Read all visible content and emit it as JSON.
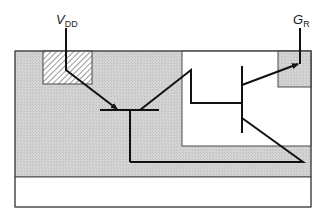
{
  "diagram": {
    "type": "transistor-cross-section",
    "labels": {
      "vdd": {
        "main": "V",
        "sub": "DD"
      },
      "gr": {
        "main": "G",
        "sub": "R"
      }
    },
    "colors": {
      "substrate": "#d0d0d0",
      "well": "#ffffff",
      "outline": "#4a4a4a",
      "wire": "#111111",
      "hatch": "#555555",
      "background": "#ffffff"
    },
    "regions": [
      {
        "name": "p-substrate",
        "fill": "substrate"
      },
      {
        "name": "hatched-contact",
        "fill": "hatch"
      },
      {
        "name": "n-well",
        "fill": "well"
      },
      {
        "name": "gr-contact",
        "fill": "substrate"
      },
      {
        "name": "bottom-layer",
        "fill": "well"
      }
    ]
  }
}
